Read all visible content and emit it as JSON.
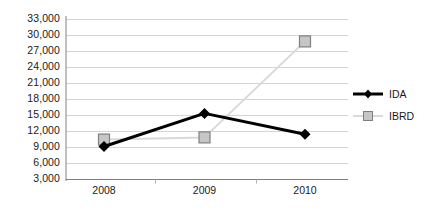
{
  "chart_data": {
    "type": "line",
    "title": "",
    "xlabel": "",
    "ylabel": "",
    "categories": [
      "2008",
      "2009",
      "2010"
    ],
    "x": [
      2008,
      2009,
      2010
    ],
    "ylim": [
      3000,
      33000
    ],
    "ytick_step": 3000,
    "yticks": [
      3000,
      6000,
      9000,
      12000,
      15000,
      18000,
      21000,
      24000,
      27000,
      30000,
      33000
    ],
    "ytick_labels": [
      "3,000",
      "6,000",
      "9,000",
      "12,000",
      "15,000",
      "18,000",
      "21,000",
      "24,000",
      "27,000",
      "30,000",
      "33,000"
    ],
    "grid": true,
    "grid_axis": "y",
    "legend_position": "right",
    "series": [
      {
        "name": "IDA",
        "values": [
          9100,
          15300,
          11400
        ],
        "color": "#000000",
        "marker": "diamond",
        "marker_color": "#000000",
        "line_width": 3
      },
      {
        "name": "IBRD",
        "values": [
          10400,
          10800,
          28800
        ],
        "color": "#d9d9d9",
        "marker": "square",
        "marker_color": "#c6c6c6",
        "marker_edge_color": "#808080",
        "line_width": 2
      }
    ]
  },
  "legend": {
    "items": [
      {
        "label": "IDA"
      },
      {
        "label": "IBRD"
      }
    ]
  },
  "colors": {
    "gridline": "#d4d4d4",
    "axis": "#808080",
    "text": "#1a1a1a",
    "background": "#ffffff",
    "ida": "#000000",
    "ibrd": "#d9d9d9"
  }
}
